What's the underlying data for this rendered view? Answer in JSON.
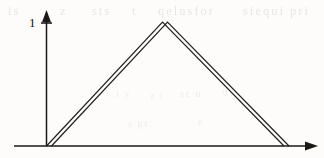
{
  "figure": {
    "kind": "triangular-waveform-plot",
    "background_color": "#fdfcfb",
    "ink_color": "#1c1814",
    "axes": {
      "y_axis": {
        "label_values": [
          "1"
        ],
        "tick_label_1": "1",
        "x": 46.5,
        "y_top": 11,
        "y_bottom": 146,
        "arrow": "up-arrowhead",
        "tick_y": 23,
        "tick_x_start": 41,
        "tick_x_end": 52
      },
      "x_axis": {
        "y": 146,
        "x_start": 14,
        "x_end": 318,
        "arrow": "right-arrowhead",
        "tick_labels": []
      }
    },
    "waveform": {
      "description": "single triangular pulse drawn as a doubled traced outline",
      "peak_value": "1",
      "stroke_color": "#211d18",
      "stroke_width": 1.15,
      "double_offset_x": 5.0,
      "vertices": [
        {
          "x": 46.5,
          "y": 146.0
        },
        {
          "x": 162.5,
          "y": 22.0
        },
        {
          "x": 284.0,
          "y": 146.0
        }
      ]
    }
  },
  "ghost_marks": {
    "note": "faint scanner bleed-through from the reverse side of the page; illegible",
    "top_row": [
      {
        "text": "is",
        "left": 8,
        "top": 6
      },
      {
        "text": "z",
        "left": 60,
        "top": 5
      },
      {
        "text": "sts",
        "left": 92,
        "top": 7
      },
      {
        "text": "t",
        "left": 132,
        "top": 5
      },
      {
        "text": "qelusfor",
        "left": 158,
        "top": 6
      },
      {
        "text": "siequi pri",
        "left": 243,
        "top": 5
      }
    ],
    "mid_row": [
      {
        "text": "i y",
        "left": 116,
        "top": 88
      },
      {
        "text": "z i",
        "left": 150,
        "top": 90
      },
      {
        "text": "sc u",
        "left": 180,
        "top": 88
      },
      {
        "text": "o",
        "left": 222,
        "top": 86
      },
      {
        "text": "s pr",
        "left": 128,
        "top": 118
      },
      {
        "text": "e",
        "left": 198,
        "top": 116
      }
    ]
  }
}
